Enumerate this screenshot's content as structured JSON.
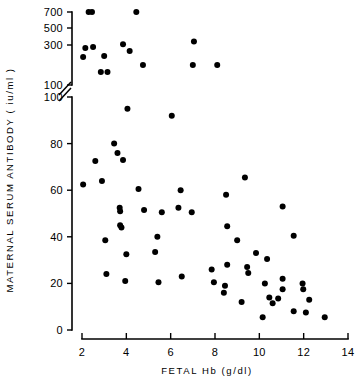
{
  "figure": {
    "background": "#ffffff",
    "marker_color": "#000000",
    "axis_color": "#000000"
  },
  "chart_data": {
    "type": "scatter",
    "title": "",
    "xlabel": "FETAL  Hb  (g/dl)",
    "ylabel": "MATERNAL  SERUM  ANTIBODY  ( iu/ml )",
    "xlim": [
      2,
      14
    ],
    "xticks": [
      2,
      4,
      6,
      8,
      10,
      12,
      14
    ],
    "xticklabels": [
      "2",
      "4",
      "6",
      "8",
      "10",
      "12",
      "14"
    ],
    "ylim": [
      0,
      700
    ],
    "yticks_lower": [
      0,
      20,
      40,
      60,
      80,
      100
    ],
    "yticklabels_lower": [
      "0",
      "20",
      "40",
      "60",
      "80",
      "100"
    ],
    "yticks_upper": [
      100,
      300,
      500,
      700
    ],
    "yticklabels_upper": [
      "100",
      "300",
      "500",
      "700"
    ],
    "axis_break": true,
    "axis_break_note": "y-axis broken between the linear 0-100 segment and the compressed 100-700 segment",
    "grid": false,
    "legend": null,
    "series": [
      {
        "name": "patients",
        "marker": "filled-circle",
        "color": "#000000",
        "points": [
          [
            2.3,
            700
          ],
          [
            2.45,
            700
          ],
          [
            4.45,
            700
          ],
          [
            7.05,
            340
          ],
          [
            2.15,
            285
          ],
          [
            2.5,
            290
          ],
          [
            3.85,
            310
          ],
          [
            4.15,
            270
          ],
          [
            2.05,
            240
          ],
          [
            3.0,
            245
          ],
          [
            2.85,
            165
          ],
          [
            3.15,
            165
          ],
          [
            4.75,
            200
          ],
          [
            7.0,
            200
          ],
          [
            8.1,
            200
          ],
          [
            4.05,
            95
          ],
          [
            6.05,
            92
          ],
          [
            3.45,
            80
          ],
          [
            3.6,
            76
          ],
          [
            3.85,
            73
          ],
          [
            2.6,
            72.5
          ],
          [
            2.05,
            62.5
          ],
          [
            2.9,
            64
          ],
          [
            9.35,
            65.5
          ],
          [
            4.55,
            60.5
          ],
          [
            6.45,
            60
          ],
          [
            8.5,
            58
          ],
          [
            3.7,
            52.5
          ],
          [
            3.72,
            51
          ],
          [
            4.8,
            51.5
          ],
          [
            5.6,
            50.5
          ],
          [
            6.35,
            52.5
          ],
          [
            6.95,
            50.5
          ],
          [
            11.05,
            53
          ],
          [
            3.72,
            45
          ],
          [
            3.78,
            44
          ],
          [
            8.55,
            44.5
          ],
          [
            3.05,
            38.5
          ],
          [
            5.4,
            40
          ],
          [
            9.0,
            38.5
          ],
          [
            11.55,
            40.5
          ],
          [
            4.0,
            32.5
          ],
          [
            5.3,
            33.5
          ],
          [
            9.85,
            33
          ],
          [
            10.35,
            30.5
          ],
          [
            3.1,
            24
          ],
          [
            7.85,
            26
          ],
          [
            8.55,
            28
          ],
          [
            9.45,
            27
          ],
          [
            9.5,
            24.5
          ],
          [
            3.95,
            21
          ],
          [
            5.45,
            20.5
          ],
          [
            6.5,
            23
          ],
          [
            7.95,
            20.5
          ],
          [
            10.25,
            20
          ],
          [
            11.05,
            22
          ],
          [
            11.05,
            17.5
          ],
          [
            11.95,
            20
          ],
          [
            11.98,
            17.5
          ],
          [
            8.45,
            19
          ],
          [
            8.4,
            16
          ],
          [
            10.45,
            14
          ],
          [
            10.85,
            13.5
          ],
          [
            12.25,
            13
          ],
          [
            9.2,
            12
          ],
          [
            10.6,
            11.5
          ],
          [
            11.55,
            8
          ],
          [
            12.1,
            7.5
          ],
          [
            10.15,
            5.5
          ],
          [
            12.95,
            5.5
          ]
        ]
      }
    ]
  }
}
